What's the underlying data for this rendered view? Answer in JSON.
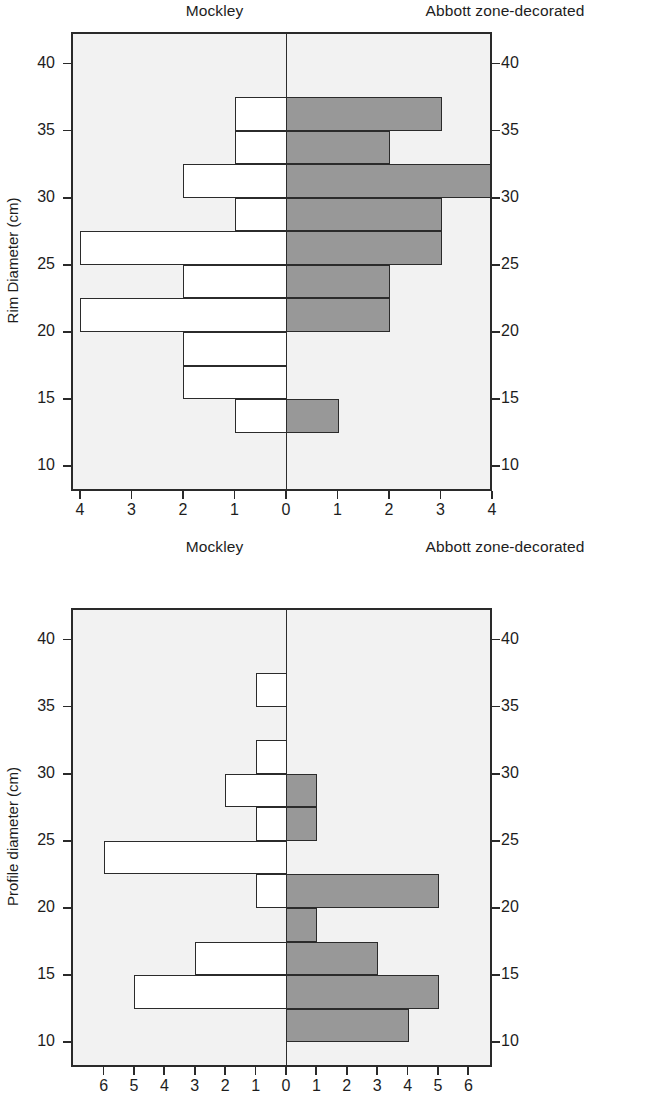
{
  "figure": {
    "panels": [
      {
        "id": "rim-diameter",
        "left_title": "Mockley",
        "right_title": "Abbott zone-decorated",
        "y_axis_title": "Rim Diameter (cm)",
        "y_ticks": [
          40,
          35,
          30,
          25,
          20,
          15,
          10
        ],
        "x_ticks_left": [
          4,
          3,
          2,
          1
        ],
        "x_tick_center": 0,
        "x_ticks_right": [
          1,
          2,
          3,
          4
        ]
      },
      {
        "id": "profile-diameter",
        "left_title": "Mockley",
        "right_title": "Abbott  zone-decorated",
        "y_axis_title": "Profile diameter (cm)",
        "y_ticks": [
          40,
          35,
          30,
          25,
          20,
          15,
          10
        ],
        "x_ticks_left": [
          6,
          5,
          4,
          3,
          2,
          1
        ],
        "x_tick_center": 0,
        "x_ticks_right": [
          1,
          2,
          3,
          4,
          5,
          6
        ]
      }
    ]
  },
  "chart_data": [
    {
      "type": "bar",
      "orientation": "horizontal",
      "style": "back-to-back population pyramid histogram",
      "title": "Rim Diameter (cm) — Mockley vs Abbott zone-decorated",
      "xlabel": "Count",
      "ylabel": "Rim Diameter (cm)",
      "ylim": [
        8,
        42
      ],
      "xlim": [
        -4.5,
        4.5
      ],
      "x_tick_labels": [
        "4",
        "3",
        "2",
        "1",
        "0",
        "1",
        "2",
        "3",
        "4"
      ],
      "y_tick_labels": [
        "40",
        "35",
        "30",
        "25",
        "20",
        "15",
        "10"
      ],
      "bin_width": 2.5,
      "grid": false,
      "legend": "panel column headers",
      "bins": [
        {
          "low": 35.0,
          "high": 37.5
        },
        {
          "low": 32.5,
          "high": 35.0
        },
        {
          "low": 30.0,
          "high": 32.5
        },
        {
          "low": 27.5,
          "high": 30.0
        },
        {
          "low": 25.0,
          "high": 27.5
        },
        {
          "low": 22.5,
          "high": 25.0
        },
        {
          "low": 20.0,
          "high": 22.5
        },
        {
          "low": 17.5,
          "high": 20.0
        },
        {
          "low": 15.0,
          "high": 17.5
        },
        {
          "low": 12.5,
          "high": 15.0
        }
      ],
      "series": [
        {
          "name": "Mockley",
          "side": "left",
          "fill": "#ffffff",
          "values": [
            1,
            1,
            2,
            1,
            4,
            2,
            4,
            2,
            2,
            1
          ]
        },
        {
          "name": "Abbott zone-decorated",
          "side": "right",
          "fill": "#989898",
          "values": [
            3,
            2,
            4,
            3,
            3,
            2,
            2,
            0,
            0,
            1
          ]
        }
      ]
    },
    {
      "type": "bar",
      "orientation": "horizontal",
      "style": "back-to-back population pyramid histogram",
      "title": "Profile diameter (cm) — Mockley vs Abbott zone-decorated",
      "xlabel": "Count",
      "ylabel": "Profile diameter (cm)",
      "ylim": [
        8,
        42
      ],
      "xlim": [
        -6.5,
        6.5
      ],
      "x_tick_labels": [
        "6",
        "5",
        "4",
        "3",
        "2",
        "1",
        "0",
        "1",
        "2",
        "3",
        "4",
        "5",
        "6"
      ],
      "y_tick_labels": [
        "40",
        "35",
        "30",
        "25",
        "20",
        "15",
        "10"
      ],
      "bin_width": 2.5,
      "grid": false,
      "legend": "panel column headers",
      "bins": [
        {
          "low": 35.0,
          "high": 37.5
        },
        {
          "low": 32.5,
          "high": 35.0
        },
        {
          "low": 30.0,
          "high": 32.5
        },
        {
          "low": 27.5,
          "high": 30.0
        },
        {
          "low": 25.0,
          "high": 27.5
        },
        {
          "low": 22.5,
          "high": 25.0
        },
        {
          "low": 20.0,
          "high": 22.5
        },
        {
          "low": 17.5,
          "high": 20.0
        },
        {
          "low": 15.0,
          "high": 17.5
        },
        {
          "low": 12.5,
          "high": 15.0
        },
        {
          "low": 10.0,
          "high": 12.5
        }
      ],
      "series": [
        {
          "name": "Mockley",
          "side": "left",
          "fill": "#ffffff",
          "values": [
            1,
            0,
            1,
            2,
            1,
            6,
            1,
            0,
            3,
            5,
            0
          ]
        },
        {
          "name": "Abbott  zone-decorated",
          "side": "right",
          "fill": "#989898",
          "values": [
            0,
            0,
            0,
            1,
            1,
            0,
            5,
            1,
            3,
            5,
            4
          ]
        }
      ]
    }
  ],
  "colors": {
    "plot_background": "#f2f2f2",
    "frame": "#2a2a2a",
    "left_bar_fill": "#ffffff",
    "right_bar_fill": "#989898",
    "bar_outline": "#2b2b2b",
    "text": "#1d1d1d",
    "page_background": "#ffffff"
  }
}
